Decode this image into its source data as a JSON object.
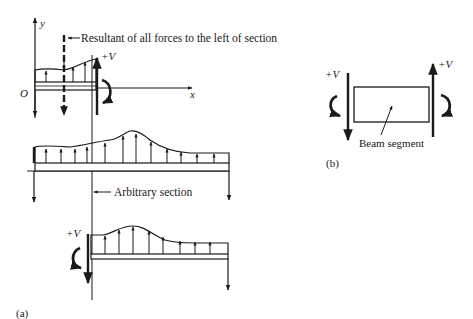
{
  "figure": {
    "part_a": {
      "tag": "(a)",
      "axes": {
        "y_label": "y",
        "x_label": "x",
        "origin_label": "O"
      },
      "resultant_label": "Resultant of all forces to the left of section",
      "shear_label_top": "+V",
      "section_label": "Arbitrary section",
      "shear_label_bottom": "+V"
    },
    "part_b": {
      "tag": "(b)",
      "shear_label_left": "+V",
      "shear_label_right": "+V",
      "segment_label": "Beam segment"
    },
    "colors": {
      "ink": "#1a1a1a",
      "background": "#ffffff"
    }
  }
}
